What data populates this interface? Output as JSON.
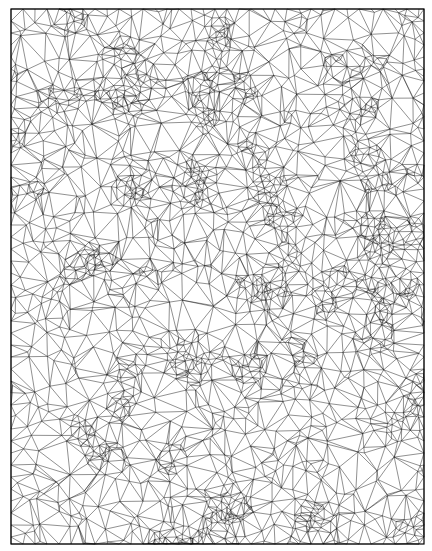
{
  "figure": {
    "kind": "triangulation-mesh",
    "width": 432,
    "height": 551,
    "bounds": {
      "left": 11,
      "top": 9,
      "right": 424,
      "bottom": 544
    },
    "point_count": 2300,
    "seed": 1337,
    "cluster_count": 70,
    "cluster_fraction": 0.55,
    "cluster_radius": 18,
    "colors": {
      "background": "#ffffff",
      "stroke": "#111111",
      "border": "#000000"
    },
    "stroke_width": 0.55,
    "stroke_opacity": 0.85
  }
}
